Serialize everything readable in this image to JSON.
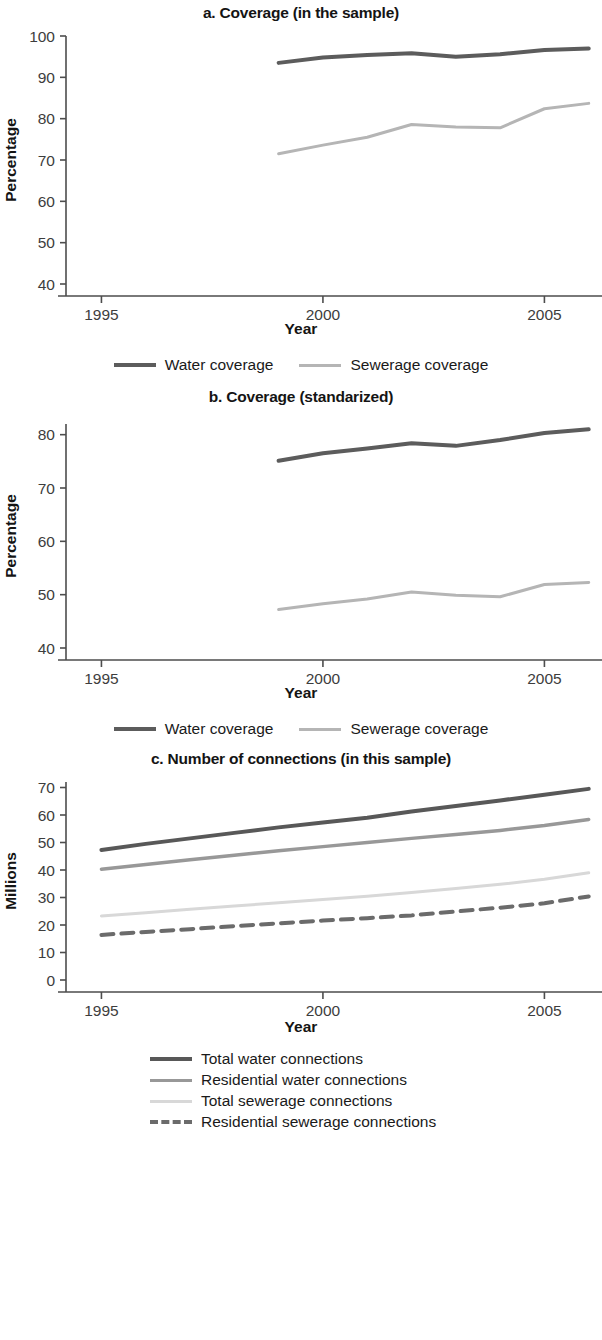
{
  "colors": {
    "water": "#5c5c5c",
    "sewerage": "#b5b5b5",
    "total_water": "#585858",
    "residential_water": "#989898",
    "total_sewerage": "#d8d8d8",
    "residential_sewerage": "#6b6b6b",
    "axis": "#4d4d4d",
    "text": "#1a1a1a"
  },
  "panels": {
    "a": {
      "title": "a. Coverage (in the sample)",
      "xlabel": "Year",
      "ylabel": "Percentage",
      "yticks": [
        "100",
        "90",
        "80",
        "70",
        "60",
        "50",
        "40"
      ],
      "xticks": [
        "1995",
        "2000",
        "2005"
      ],
      "legend": [
        {
          "label": "Water coverage",
          "color": "#5c5c5c",
          "width": 4,
          "dash": "none"
        },
        {
          "label": "Sewerage coverage",
          "color": "#b5b5b5",
          "width": 3,
          "dash": "none"
        }
      ]
    },
    "b": {
      "title": "b. Coverage (standarized)",
      "xlabel": "Year",
      "ylabel": "Percentage",
      "yticks": [
        "80",
        "70",
        "60",
        "50",
        "40"
      ],
      "xticks": [
        "1995",
        "2000",
        "2005"
      ],
      "legend": [
        {
          "label": "Water coverage",
          "color": "#5c5c5c",
          "width": 4,
          "dash": "none"
        },
        {
          "label": "Sewerage coverage",
          "color": "#b5b5b5",
          "width": 3,
          "dash": "none"
        }
      ]
    },
    "c": {
      "title": "c. Number of connections (in this sample)",
      "xlabel": "Year",
      "ylabel": "Millions",
      "yticks": [
        "70",
        "60",
        "50",
        "40",
        "30",
        "20",
        "10",
        "0"
      ],
      "xticks": [
        "1995",
        "2000",
        "2005"
      ],
      "legend": [
        {
          "label": "Total water connections",
          "color": "#585858",
          "width": 4,
          "dash": "none"
        },
        {
          "label": "Residential water connections",
          "color": "#989898",
          "width": 3.5,
          "dash": "none"
        },
        {
          "label": "Total sewerage connections",
          "color": "#d8d8d8",
          "width": 3,
          "dash": "none"
        },
        {
          "label": "Residential sewerage connections",
          "color": "#6b6b6b",
          "width": 4,
          "dash": "12 8"
        }
      ]
    }
  },
  "chart_data": [
    {
      "type": "line",
      "title": "a. Coverage (in the sample)",
      "xlabel": "Year",
      "ylabel": "Percentage",
      "xlim": [
        1994.2,
        2006.3
      ],
      "ylim": [
        40,
        100
      ],
      "xticks": [
        1995,
        2000,
        2005
      ],
      "yticks": [
        40,
        50,
        60,
        70,
        80,
        90,
        100
      ],
      "grid": false,
      "legend_position": "bottom",
      "x": [
        1999,
        2000,
        2001,
        2002,
        2003,
        2004,
        2005,
        2006
      ],
      "series": [
        {
          "name": "Water coverage",
          "values": [
            93.5,
            94.8,
            95.4,
            95.8,
            95.0,
            95.6,
            96.6,
            97.0
          ]
        },
        {
          "name": "Sewerage coverage",
          "values": [
            71.5,
            73.6,
            75.5,
            78.6,
            78.0,
            77.8,
            82.4,
            83.7
          ]
        }
      ]
    },
    {
      "type": "line",
      "title": "b. Coverage (standarized)",
      "xlabel": "Year",
      "ylabel": "Percentage",
      "xlim": [
        1994.2,
        2006.3
      ],
      "ylim": [
        40,
        82
      ],
      "xticks": [
        1995,
        2000,
        2005
      ],
      "yticks": [
        40,
        50,
        60,
        70,
        80
      ],
      "grid": false,
      "legend_position": "bottom",
      "x": [
        1999,
        2000,
        2001,
        2002,
        2003,
        2004,
        2005,
        2006
      ],
      "series": [
        {
          "name": "Water coverage",
          "values": [
            75.1,
            76.5,
            77.4,
            78.4,
            77.9,
            79.0,
            80.3,
            81.0
          ]
        },
        {
          "name": "Sewerage coverage",
          "values": [
            47.2,
            48.3,
            49.2,
            50.5,
            49.9,
            49.6,
            51.9,
            52.3
          ]
        }
      ]
    },
    {
      "type": "line",
      "title": "c. Number of connections (in this sample)",
      "xlabel": "Year",
      "ylabel": "Millions",
      "xlim": [
        1994.2,
        2006.3
      ],
      "ylim": [
        0,
        72
      ],
      "xticks": [
        1995,
        2000,
        2005
      ],
      "yticks": [
        0,
        10,
        20,
        30,
        40,
        50,
        60,
        70
      ],
      "grid": false,
      "legend_position": "bottom",
      "x": [
        1995,
        1996,
        1997,
        1998,
        1999,
        2000,
        2001,
        2002,
        2003,
        2004,
        2005,
        2006
      ],
      "series": [
        {
          "name": "Total water connections",
          "values": [
            47.3,
            49.5,
            51.5,
            53.5,
            55.5,
            57.3,
            59.0,
            61.3,
            63.3,
            65.3,
            67.4,
            69.5
          ]
        },
        {
          "name": "Residential water connections",
          "values": [
            40.3,
            42.0,
            43.7,
            45.4,
            47.0,
            48.5,
            50.0,
            51.5,
            52.9,
            54.4,
            56.2,
            58.4
          ]
        },
        {
          "name": "Total sewerage connections",
          "values": [
            23.3,
            24.5,
            25.7,
            26.9,
            28.1,
            29.3,
            30.5,
            31.8,
            33.3,
            34.8,
            36.6,
            39.0
          ]
        },
        {
          "name": "Residential sewerage connections",
          "values": [
            16.4,
            17.5,
            18.5,
            19.6,
            20.6,
            21.6,
            22.5,
            23.5,
            24.9,
            26.3,
            27.9,
            30.4
          ]
        }
      ]
    }
  ]
}
